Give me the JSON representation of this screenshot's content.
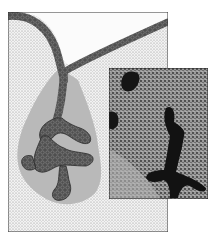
{
  "figure": {
    "type": "histology illustration with micrograph inset",
    "caption_remnant": "",
    "colors": {
      "background": "#ffffff",
      "stroma_stipple": "#d9d9d9",
      "clear_lumen": "#f7f7f7",
      "epithelium": "#4a4a4a",
      "epithelium_cells": "#6e6e6e",
      "halo": "#b4b4b4",
      "frame": "#333333",
      "inset_bg": "#8a8a8a",
      "inset_dark": "#1a1a1a"
    },
    "main_panel": {
      "x": 8,
      "y": 12,
      "width": 160,
      "height": 220
    },
    "inset_panel": {
      "x": 109,
      "y": 68,
      "width": 99,
      "height": 131
    }
  }
}
